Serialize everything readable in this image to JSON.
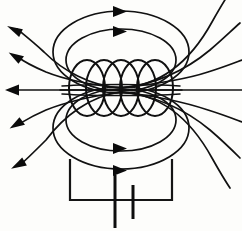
{
  "figure": {
    "title": "Magnetic field of a current-carrying solenoid",
    "caption": "Solenoid coil connected to a battery with magnetic field lines",
    "background_color": "#fdfdfb",
    "line_color": "#111111",
    "width": 242,
    "height": 231
  },
  "coil": {
    "label": "solenoid-coil",
    "turns": 5,
    "turn_width": 36,
    "turn_height": 56,
    "center_y": 88,
    "first_center_x": 87,
    "turn_spacing": 17,
    "stroke_color": "#101010"
  },
  "field_lines": {
    "label": "magnetic-field-lines",
    "top_loops": [
      {
        "name": "outer-top-loop",
        "rx": 68,
        "ry": 40,
        "cx": 121,
        "cy": 52
      },
      {
        "name": "inner-top-loop",
        "rx": 55,
        "ry": 31,
        "cx": 121,
        "cy": 58
      }
    ],
    "bottom_loops": [
      {
        "name": "outer-bottom-loop",
        "rx": 68,
        "ry": 40,
        "cx": 121,
        "cy": 126
      },
      {
        "name": "inner-bottom-loop",
        "rx": 55,
        "ry": 31,
        "cx": 121,
        "cy": 120
      }
    ],
    "side_lines_count": 5,
    "central_axis_y": 90
  },
  "arrows": {
    "label": "field-direction-arrows",
    "top": [
      {
        "name": "arrow-top-outer",
        "x": 121,
        "y": 11,
        "direction": "right"
      },
      {
        "name": "arrow-top-inner",
        "x": 121,
        "y": 31,
        "direction": "right"
      }
    ],
    "bottom": [
      {
        "name": "arrow-bottom-inner",
        "x": 121,
        "y": 148,
        "direction": "right"
      },
      {
        "name": "arrow-bottom-outer",
        "x": 121,
        "y": 170,
        "direction": "right"
      }
    ],
    "left": [
      {
        "name": "arrow-left-upper-outer",
        "x": 12,
        "y": 31,
        "angle": -42
      },
      {
        "name": "arrow-left-upper-inner",
        "x": 13,
        "y": 58,
        "angle": -22
      },
      {
        "name": "arrow-left-axis",
        "x": 8,
        "y": 90,
        "angle": 0
      },
      {
        "name": "arrow-left-lower-inner",
        "x": 14,
        "y": 118,
        "angle": 22
      },
      {
        "name": "arrow-left-lower-outer",
        "x": 16,
        "y": 156,
        "angle": 42
      }
    ]
  },
  "circuit": {
    "label": "battery-circuit",
    "left_wire_x": 70,
    "right_wire_x": 172,
    "bottom_wire_y": 200,
    "top_y": 163,
    "stroke_color": "#151515",
    "battery": {
      "name": "battery-symbol",
      "positive_plate_x": 115,
      "positive_plate_top": 175,
      "positive_plate_bottom": 228,
      "negative_plate_x": 133,
      "negative_plate_top": 185,
      "negative_plate_bottom": 218
    }
  }
}
